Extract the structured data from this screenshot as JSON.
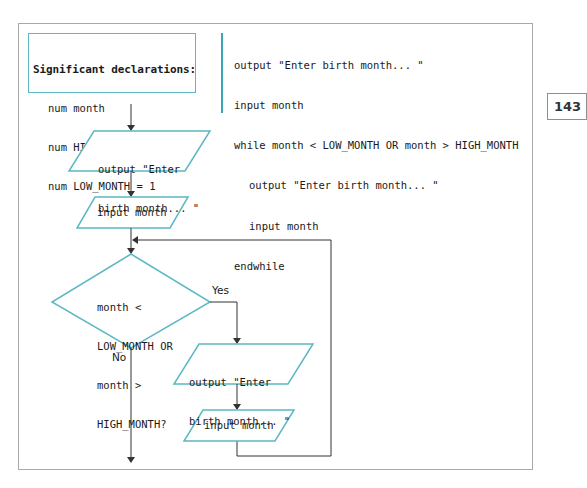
{
  "page_number": "143",
  "declarations": {
    "title": "Significant declarations:",
    "lines": [
      "num month",
      "num HIGH_MONTH = 12",
      "num LOW_MONTH = 1"
    ]
  },
  "pseudocode": {
    "lines": [
      {
        "text": "output \"Enter birth month... \"",
        "indent": false
      },
      {
        "text": "input month",
        "indent": false
      },
      {
        "text": "while month < LOW_MONTH OR month > HIGH_MONTH",
        "indent": false
      },
      {
        "text": "output \"Enter birth month... \"",
        "indent": true
      },
      {
        "text": "input month",
        "indent": true
      },
      {
        "text": "endwhile",
        "indent": false
      }
    ]
  },
  "flowchart": {
    "output_prompt_1": {
      "line1": "output \"Enter",
      "line2": "birth month... \""
    },
    "input_1": "input month",
    "decision": {
      "line1": "month <",
      "line2": "LOW_MONTH OR",
      "line3": "month >",
      "line4": "HIGH_MONTH?"
    },
    "yes_label": "Yes",
    "no_label": "No",
    "output_prompt_2": {
      "line1": "output \"Enter",
      "line2": "birth month... \""
    },
    "input_2": "input month"
  },
  "colors": {
    "shape_stroke": "#5bb8c4",
    "code_bar": "#3aa6b5",
    "line": "#333333",
    "frame": "#a9a9a9"
  }
}
